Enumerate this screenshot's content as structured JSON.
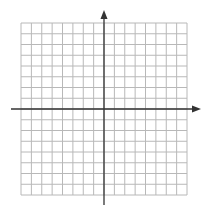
{
  "diagram": {
    "type": "coordinate-plane",
    "grid": {
      "columns": 16,
      "rows": 16,
      "left": 21,
      "top": 23,
      "right": 187,
      "bottom": 195,
      "line_color": "#b8b8b8"
    },
    "axes": {
      "color": "#333333",
      "x_axis": {
        "y": 109,
        "x_start": 11,
        "x_end": 201,
        "arrow": "right"
      },
      "y_axis": {
        "x": 104,
        "y_start": 205,
        "y_end": 10,
        "arrow": "up"
      }
    }
  }
}
